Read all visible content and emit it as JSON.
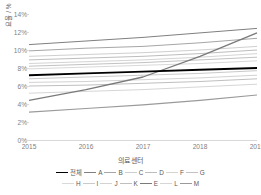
{
  "chart_data": {
    "type": "line",
    "title": "",
    "xlabel": "의료 센터",
    "ylabel": "요율 / %",
    "x": [
      2015,
      2016,
      2017,
      2018,
      2019
    ],
    "xticklabels": [
      "2015",
      "2016",
      "2017",
      "2018",
      "2019"
    ],
    "yticklabels": [
      "0%",
      "2%",
      "4%",
      "6%",
      "8%",
      "10%",
      "12%",
      "14%"
    ],
    "ytickvalues": [
      0,
      2,
      4,
      6,
      8,
      10,
      12,
      14
    ],
    "ylim": [
      0,
      14
    ],
    "xlim": [
      2015,
      2019
    ],
    "grid": false,
    "legend_position": "bottom",
    "legend_title": "의료 센터",
    "units": "%",
    "series": [
      {
        "name": "전체",
        "color": "#000000",
        "width": 1.9,
        "values": [
          7.2,
          7.4,
          7.6,
          7.8,
          8.0
        ]
      },
      {
        "name": "A",
        "color": "#808080",
        "width": 1.0,
        "values": [
          10.6,
          11.0,
          11.4,
          11.9,
          12.4
        ]
      },
      {
        "name": "B",
        "color": "#a6a6a6",
        "width": 1.0,
        "values": [
          9.9,
          10.2,
          10.4,
          10.8,
          11.3
        ]
      },
      {
        "name": "C",
        "color": "#cfcfcf",
        "width": 1.0,
        "values": [
          9.3,
          9.5,
          9.7,
          10.0,
          10.4
        ]
      },
      {
        "name": "D",
        "color": "#bdbdbd",
        "width": 1.0,
        "values": [
          8.9,
          9.1,
          9.3,
          9.6,
          10.0
        ]
      },
      {
        "name": "F",
        "color": "#d4d4d4",
        "width": 1.0,
        "values": [
          8.5,
          8.7,
          8.9,
          9.2,
          9.6
        ]
      },
      {
        "name": "G",
        "color": "#c2c2c2",
        "width": 1.0,
        "values": [
          8.2,
          8.4,
          8.6,
          8.9,
          9.2
        ]
      },
      {
        "name": "H",
        "color": "#d9d9d9",
        "width": 1.0,
        "values": [
          7.9,
          8.1,
          8.3,
          8.5,
          8.8
        ]
      },
      {
        "name": "I",
        "color": "#cacaca",
        "width": 1.0,
        "values": [
          6.8,
          7.0,
          7.2,
          7.4,
          7.7
        ]
      },
      {
        "name": "J",
        "color": "#d2d2d2",
        "width": 1.0,
        "values": [
          6.4,
          6.5,
          6.7,
          6.9,
          7.2
        ]
      },
      {
        "name": "K",
        "color": "#bfbfbf",
        "width": 1.0,
        "values": [
          6.0,
          6.1,
          6.3,
          6.5,
          6.8
        ]
      },
      {
        "name": "E",
        "color": "#7a7a7a",
        "width": 1.3,
        "values": [
          4.4,
          5.6,
          7.0,
          9.3,
          11.9
        ]
      },
      {
        "name": "L",
        "color": "#d6d6d6",
        "width": 1.0,
        "values": [
          5.2,
          5.4,
          5.6,
          5.9,
          6.2
        ]
      },
      {
        "name": "M",
        "color": "#9a9a9a",
        "width": 1.2,
        "values": [
          3.1,
          3.5,
          3.9,
          4.4,
          5.0
        ]
      }
    ],
    "legend_rows": [
      [
        "전체",
        "A",
        "B",
        "C",
        "D",
        "F",
        "G"
      ],
      [
        "H",
        "I",
        "J",
        "K",
        "E",
        "L",
        "M"
      ]
    ]
  }
}
